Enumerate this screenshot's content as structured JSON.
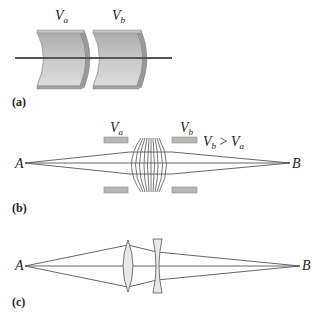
{
  "figure": {
    "panel_a": {
      "label": "(a)",
      "electrode_left": {
        "symbol": "V",
        "subscript": "a"
      },
      "electrode_right": {
        "symbol": "V",
        "subscript": "b"
      }
    },
    "panel_b": {
      "label": "(b)",
      "electrode_left": {
        "symbol": "V",
        "subscript": "a"
      },
      "electrode_right": {
        "symbol": "V",
        "subscript": "b"
      },
      "condition": {
        "lhs": "V",
        "lhs_sub": "b",
        "op": " > ",
        "rhs": "V",
        "rhs_sub": "a"
      },
      "point_start": "A",
      "point_end": "B"
    },
    "panel_c": {
      "label": "(c)",
      "point_start": "A",
      "point_end": "B"
    },
    "colors": {
      "line": "#555555",
      "electrode_fill": "#b8b8b8",
      "electrode_edge": "#8a8a8a",
      "lens_fill": "#e8e8e8"
    }
  }
}
